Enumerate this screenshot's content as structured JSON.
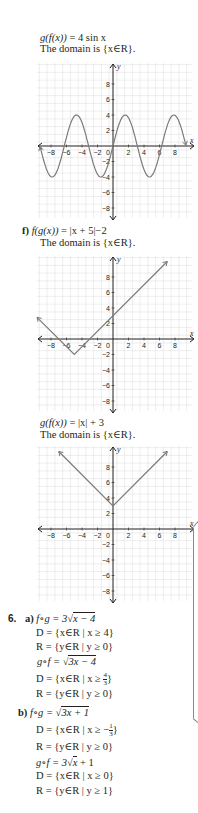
{
  "sections": {
    "e_gf": {
      "expr_lhs": "g(f(x))",
      "expr_rhs": " = 4 sin x",
      "domain_text": "The domain is {x∈R}."
    },
    "f": {
      "label": "f)",
      "expr_lhs": "f(g(x))",
      "expr_rhs": " = |x + 5|−2",
      "domain_text": "The domain is {x∈R}."
    },
    "f_gf": {
      "expr_lhs": "g(f(x))",
      "expr_rhs": " = |x| + 3",
      "domain_text": "The domain is {x∈R}."
    }
  },
  "q6": {
    "number": "6.",
    "a": {
      "label": "a)",
      "fog": "f∘g = 3√",
      "fog_rad": "x − 4",
      "fog_D": "D = {x∈R | x ≥ 4}",
      "fog_R": "R = {y∈R | y ≥ 0}",
      "gof": "g∘f = √",
      "gof_rad": "3x − 4",
      "gof_D_pre": "D = {x∈R | x ≥ ",
      "gof_D_num": "4",
      "gof_D_den": "3",
      "gof_D_post": "}",
      "gof_R": "R = {y∈R | y ≥ 0}"
    },
    "b": {
      "label": "b)",
      "fog": "f∘g = √",
      "fog_rad": "3x + 1",
      "fog_D_pre": "D = {x∈R | x ≥ −",
      "fog_D_num": "1",
      "fog_D_den": "3",
      "fog_D_post": "}",
      "fog_R": "R = {y∈R | y ≥ 0}",
      "gof": "g∘f = 3√",
      "gof_rad": "x",
      "gof_tail": " + 1",
      "gof_D": "D = {x∈R | x ≥ 0}",
      "gof_R": "R = {y∈R | y ≥ 1}"
    }
  },
  "chart_data": [
    {
      "type": "line",
      "title": "g(f(x)) = 4 sin x",
      "function": "4*sin(x)",
      "xlabel": "x",
      "ylabel": "y",
      "xlim": [
        -10,
        10
      ],
      "ylim": [
        -10,
        10
      ],
      "xticks": [
        -8,
        -6,
        -4,
        -2,
        0,
        2,
        4,
        6,
        8
      ],
      "yticks": [
        8,
        6,
        4,
        2,
        -2,
        -4,
        -6,
        -8
      ],
      "grid": true,
      "x_range": [
        -9.4,
        9.4
      ],
      "sample_points": [
        [
          -7.85,
          -4
        ],
        [
          -4.71,
          4
        ],
        [
          -1.57,
          -4
        ],
        [
          0,
          0
        ],
        [
          1.57,
          4
        ],
        [
          4.71,
          -4
        ],
        [
          7.85,
          4
        ]
      ]
    },
    {
      "type": "line",
      "title": "f(g(x)) = |x + 5| − 2",
      "function": "abs(x+5)-2",
      "xlabel": "x",
      "ylabel": "y",
      "xlim": [
        -10,
        10
      ],
      "ylim": [
        -10,
        10
      ],
      "xticks": [
        -8,
        -6,
        -4,
        -2,
        0,
        2,
        4,
        6,
        8
      ],
      "yticks": [
        8,
        6,
        4,
        2,
        -2,
        -4,
        -6,
        -8
      ],
      "grid": true,
      "points": [
        [
          -9.8,
          2.8
        ],
        [
          -5,
          -2
        ],
        [
          7,
          10
        ]
      ]
    },
    {
      "type": "line",
      "title": "g(f(x)) = |x| + 3",
      "function": "abs(x)+3",
      "xlabel": "x",
      "ylabel": "y",
      "xlim": [
        -10,
        10
      ],
      "ylim": [
        -10,
        10
      ],
      "xticks": [
        -8,
        -6,
        -4,
        -2,
        0,
        2,
        4,
        6,
        8
      ],
      "yticks": [
        8,
        6,
        4,
        2,
        -2,
        -4,
        -6,
        -8
      ],
      "grid": true,
      "points": [
        [
          -7,
          10
        ],
        [
          0,
          3
        ],
        [
          7,
          10
        ]
      ]
    }
  ],
  "colors": {
    "curve": "#7a7a7a",
    "grid": "#dcdcdc",
    "axis": "#231f20",
    "text": "#231f20"
  }
}
